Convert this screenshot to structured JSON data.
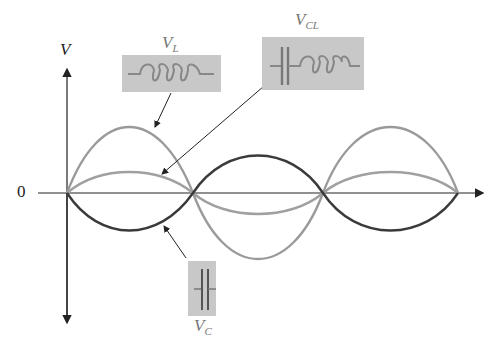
{
  "diagram": {
    "axis": {
      "y_label": "V",
      "origin_label": "0"
    },
    "components": [
      {
        "id": "VL",
        "label_main": "V",
        "label_sub": "L",
        "symbol": "inductor",
        "curve_color": "#9a9a9a",
        "amplitude": 67
      },
      {
        "id": "VCL",
        "label_main": "V",
        "label_sub": "CL",
        "symbol": "capacitor-inductor",
        "curve_color": "#a0a0a0",
        "amplitude": 21
      },
      {
        "id": "VC",
        "label_main": "V",
        "label_sub": "C",
        "symbol": "capacitor",
        "curve_color": "#3a3a3a",
        "amplitude": -38
      }
    ],
    "colors": {
      "box_fill": "#c8c8c8",
      "symbol_stroke": "#888888",
      "axis": "#222222"
    }
  }
}
